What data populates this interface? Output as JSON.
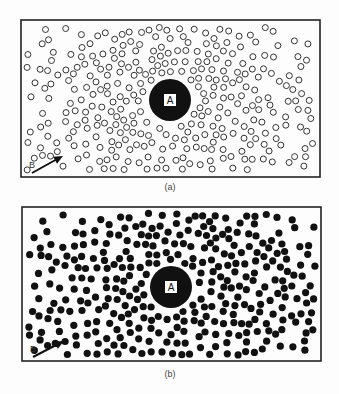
{
  "panels": [
    {
      "id": "a",
      "caption": "(a)",
      "frame": {
        "x": 21,
        "y": 20,
        "w": 299,
        "h": 157
      },
      "center": {
        "x": 170,
        "y": 100,
        "label": "A",
        "disc_radius": 21
      },
      "particle_style": "hollow",
      "arrow": {
        "label": "B",
        "from": [
          32,
          173
        ],
        "to": [
          63,
          156
        ]
      },
      "caption_pos": {
        "x": 150,
        "y": 182
      }
    },
    {
      "id": "b",
      "caption": "(b)",
      "frame": {
        "x": 22,
        "y": 207,
        "w": 299,
        "h": 154
      },
      "center": {
        "x": 171,
        "y": 287,
        "label": "A",
        "disc_radius": 21
      },
      "particle_style": "filled",
      "arrow": {
        "label": "B",
        "from": [
          33,
          357
        ],
        "to": [
          64,
          341
        ]
      },
      "caption_pos": {
        "x": 150,
        "y": 369
      }
    }
  ],
  "particles": {
    "radius": 3,
    "stroke": "#333333",
    "fill_filled": "#111111",
    "halo_width": 3
  },
  "colors": {
    "ink": "#111111",
    "paper": "#fdfdfd",
    "frame": "#222222"
  }
}
